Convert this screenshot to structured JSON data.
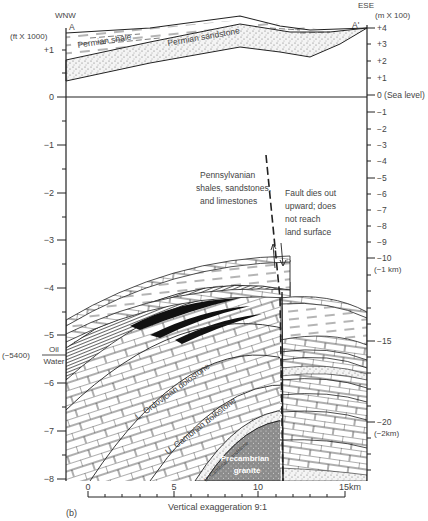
{
  "figure": {
    "panel_label": "(b)",
    "section_start": "A",
    "section_end": "A'",
    "direction_left": "WNW",
    "direction_right": "ESE",
    "vertical_exaggeration": "Vertical exaggeration 9:1"
  },
  "left_axis": {
    "unit": "(ft X 1000)",
    "ticks": [
      {
        "label": "+1",
        "value": 1
      },
      {
        "label": "0",
        "value": 0
      },
      {
        "label": "−1",
        "value": -1
      },
      {
        "label": "−2",
        "value": -2
      },
      {
        "label": "−3",
        "value": -3
      },
      {
        "label": "−4",
        "value": -4
      },
      {
        "label": "−5",
        "value": -5
      },
      {
        "label": "−6",
        "value": -6
      },
      {
        "label": "−7",
        "value": -7
      },
      {
        "label": "−8",
        "value": -8
      }
    ],
    "oil_label": "Oil",
    "water_label": "Water",
    "contact_depth": "(−5400)"
  },
  "right_axis": {
    "unit": "(m X 100)",
    "ticks": [
      {
        "label": "+4"
      },
      {
        "label": "+3"
      },
      {
        "label": "+2"
      },
      {
        "label": "+1"
      },
      {
        "label": "0 (Sea level)"
      },
      {
        "label": "−1"
      },
      {
        "label": "−2"
      },
      {
        "label": "−3"
      },
      {
        "label": "−4"
      },
      {
        "label": "−5"
      },
      {
        "label": "−6"
      },
      {
        "label": "−7"
      },
      {
        "label": "−8"
      },
      {
        "label": "−9"
      },
      {
        "label": "−10"
      },
      {
        "label": "−15"
      },
      {
        "label": "−20"
      }
    ],
    "km_1": "(−1 km)",
    "km_2": "(−2km)"
  },
  "bottom_scale": {
    "ticks": [
      "0",
      "5",
      "10",
      "15km"
    ]
  },
  "units": {
    "permian_shale": "Permian shale",
    "permian_sandstone": "Permian sandstone",
    "pennsylvanian": [
      "Pennsylvanian",
      "shales, sandstones,",
      "and limestones"
    ],
    "ordovician": "L. Ordovician dolostone",
    "cambrian_dolostone": "U. Cambrian dolostone",
    "cambrian_sandstone": "U. Cambrian sandstone",
    "granite": [
      "Precambrian",
      "granite"
    ]
  },
  "annotations": {
    "fault_note": [
      "Fault dies out",
      "upward; does",
      "not reach",
      "land surface"
    ]
  },
  "colors": {
    "ink": "#222222",
    "text": "#444444",
    "granite_fill": "#8c8c8c",
    "oil_fill": "#111111"
  }
}
